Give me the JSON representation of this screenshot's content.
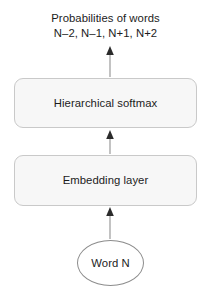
{
  "diagram": {
    "title_lines": [
      "Probabilities of words",
      "N–2, N–1, N+1, N+2"
    ],
    "nodes": {
      "softmax_label": "Hierarchical softmax",
      "embedding_label": "Embedding layer",
      "word_label": "Word N"
    },
    "colors": {
      "box_fill": "#f7f7f7",
      "box_stroke": "#c9c9c9",
      "node_stroke": "#8c8c8c",
      "arrow": "#9a9a9a",
      "text": "#1c1c1c",
      "background": "#ffffff"
    },
    "arrows": [
      {
        "name": "embedding-to-softmax",
        "from": "Embedding layer",
        "to": "Hierarchical softmax"
      },
      {
        "name": "word-to-embedding",
        "from": "Word N",
        "to": "Embedding layer"
      },
      {
        "name": "softmax-to-output",
        "from": "Hierarchical softmax",
        "to": "Probabilities of words"
      }
    ]
  }
}
